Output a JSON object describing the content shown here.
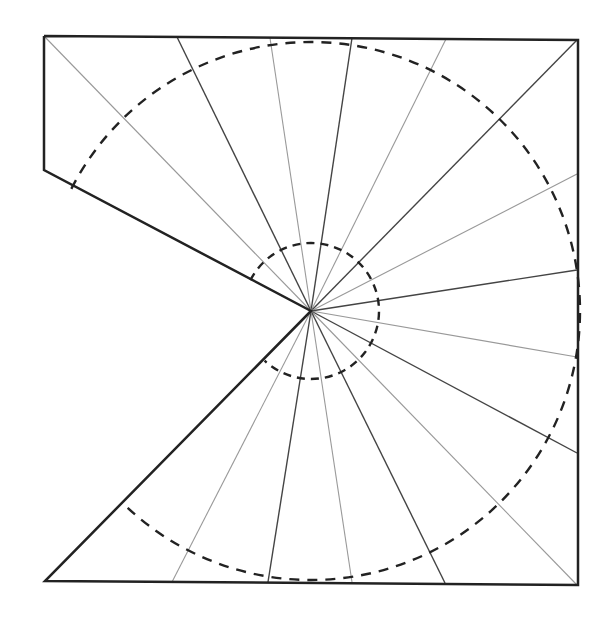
{
  "diagram": {
    "type": "crease-pattern",
    "center": [
      311,
      311
    ],
    "outline": [
      [
        44,
        36
      ],
      [
        578,
        40
      ],
      [
        578,
        585
      ],
      [
        45,
        581
      ],
      [
        311,
        311
      ],
      [
        44,
        170
      ],
      [
        44,
        36
      ]
    ],
    "outline_color": "#222222",
    "dark_line_color": "#444444",
    "light_line_color": "#999999",
    "rays": [
      {
        "end": [
          44,
          36
        ],
        "tone": "light"
      },
      {
        "end": [
          177,
          37
        ],
        "tone": "dark"
      },
      {
        "end": [
          270,
          38
        ],
        "tone": "light"
      },
      {
        "end": [
          352,
          38
        ],
        "tone": "dark"
      },
      {
        "end": [
          446,
          39
        ],
        "tone": "light"
      },
      {
        "end": [
          577,
          40
        ],
        "tone": "dark"
      },
      {
        "end": [
          577,
          174
        ],
        "tone": "light"
      },
      {
        "end": [
          577,
          270
        ],
        "tone": "dark"
      },
      {
        "end": [
          577,
          357
        ],
        "tone": "light"
      },
      {
        "end": [
          577,
          453
        ],
        "tone": "dark"
      },
      {
        "end": [
          577,
          585
        ],
        "tone": "light"
      },
      {
        "end": [
          445,
          583
        ],
        "tone": "dark"
      },
      {
        "end": [
          352,
          582
        ],
        "tone": "light"
      },
      {
        "end": [
          268,
          582
        ],
        "tone": "dark"
      },
      {
        "end": [
          172,
          582
        ],
        "tone": "light"
      }
    ],
    "dashed_circles": [
      {
        "r": 269,
        "start_deg": 207,
        "end_deg": 493
      },
      {
        "r": 68,
        "start_deg": 207,
        "end_deg": 493
      }
    ]
  }
}
